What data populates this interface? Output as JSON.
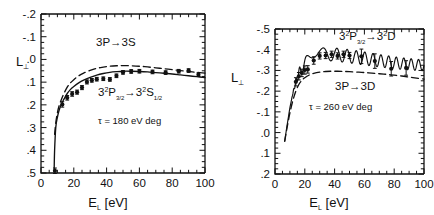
{
  "figure": {
    "background": "#ffffff",
    "ink": "#111111",
    "panels": [
      "left",
      "right"
    ]
  },
  "panel_left": {
    "xlabel_main": "E",
    "xlabel_sub": "L",
    "xlabel_unit": "[eV]",
    "ylabel_main": "L",
    "ylabel_sub": "⊥",
    "xticks": [
      "0",
      "20",
      "40",
      "60",
      "80",
      "100"
    ],
    "yticks": [
      ".5",
      ".4",
      ".3",
      ".2",
      ".1",
      ".0",
      "-.1",
      "-.2"
    ],
    "annotation_theory": "3P→3S",
    "annotation_fine": {
      "a": "3",
      "a_sup": "2",
      "b": "P",
      "b_sub": "3/2",
      "arrow": "→",
      "c": "3",
      "c_sup": "2",
      "d": "S",
      "d_sub": "1/2"
    },
    "annotation_tau": "τ = 180 eV deg"
  },
  "panel_right": {
    "xlabel_main": "E",
    "xlabel_sub": "L",
    "xlabel_unit": "[eV]",
    "ylabel_main": "L",
    "ylabel_sub": "⊥",
    "xticks": [
      "0",
      "20",
      "40",
      "60",
      "80",
      "100"
    ],
    "yticks": [
      "-.5",
      "-.4",
      "-.3",
      "-.2",
      "-.1",
      ".0",
      ".1",
      ".2"
    ],
    "annotation_fine": {
      "a": "3",
      "a_sup": "2",
      "b": "P",
      "b_sub": "3/2",
      "arrow": "→",
      "c": "3",
      "c_sup": "2",
      "d": "D"
    },
    "annotation_theory": "3P→3D",
    "annotation_tau": "τ = 260 eV deg"
  },
  "chart_data": [
    {
      "type": "line",
      "panel": "left",
      "title": "",
      "xlabel": "E_L [eV]",
      "ylabel": "L_perp",
      "xlim": [
        0,
        100
      ],
      "ylim": [
        -0.2,
        0.5
      ],
      "xticks": [
        0,
        20,
        40,
        60,
        80,
        100
      ],
      "yticks": [
        -0.2,
        -0.1,
        0.0,
        0.1,
        0.2,
        0.3,
        0.4,
        0.5
      ],
      "xminor_step": 5,
      "yminor_step": 0.025,
      "y_inverted": false,
      "grid": false,
      "legend": "none",
      "annotations": [
        {
          "text": "3P→3S",
          "x": 48,
          "y": 0.345
        },
        {
          "text": "3²P3/2→3²S1/2",
          "x": 52,
          "y": 0.135
        },
        {
          "text": "τ = 180 eV deg",
          "x": 52,
          "y": 0.02
        }
      ],
      "series": [
        {
          "name": "3P-3S theory (dashed)",
          "style": "dashed",
          "x": [
            8.3,
            9,
            10,
            11,
            12.5,
            14,
            16,
            18,
            20,
            23,
            26,
            30,
            34,
            38,
            42,
            46,
            50,
            55,
            60,
            65,
            70,
            75,
            80,
            85,
            90,
            95,
            100
          ],
          "y": [
            -0.03,
            0.02,
            0.065,
            0.095,
            0.125,
            0.15,
            0.178,
            0.197,
            0.211,
            0.228,
            0.24,
            0.252,
            0.261,
            0.266,
            0.27,
            0.272,
            0.273,
            0.272,
            0.27,
            0.267,
            0.263,
            0.259,
            0.255,
            0.251,
            0.247,
            0.243,
            0.24
          ]
        },
        {
          "name": "3²P3/2-3²S1/2 theory (solid)",
          "style": "solid",
          "x": [
            8.0,
            8.3,
            9,
            10,
            11,
            12.5,
            14,
            16,
            18,
            20,
            23,
            26,
            30,
            34,
            38,
            42,
            46,
            50,
            55,
            60,
            65,
            70,
            75,
            80,
            85,
            90,
            95,
            100
          ],
          "y": [
            -0.195,
            -0.1,
            0.0,
            0.045,
            0.075,
            0.105,
            0.125,
            0.15,
            0.168,
            0.181,
            0.197,
            0.209,
            0.221,
            0.231,
            0.238,
            0.243,
            0.246,
            0.248,
            0.248,
            0.247,
            0.245,
            0.242,
            0.239,
            0.236,
            0.232,
            0.228,
            0.224,
            0.22
          ]
        }
      ],
      "points": {
        "name": "experiment",
        "marker": "filled-circle",
        "x": [
          8.5,
          13,
          16,
          19,
          22,
          25,
          28,
          31,
          34,
          38,
          42,
          46,
          50,
          55,
          60,
          68,
          76,
          84,
          90,
          96
        ],
        "y": [
          -0.19,
          0.102,
          0.131,
          0.148,
          0.156,
          0.176,
          0.201,
          0.208,
          0.213,
          0.215,
          0.212,
          0.228,
          0.243,
          0.247,
          0.248,
          0.245,
          0.242,
          0.248,
          0.251,
          0.233
        ],
        "yerr": [
          0.012,
          0.012,
          0.01,
          0.01,
          0.009,
          0.009,
          0.009,
          0.008,
          0.008,
          0.008,
          0.008,
          0.008,
          0.008,
          0.008,
          0.008,
          0.008,
          0.008,
          0.008,
          0.008,
          0.008
        ]
      }
    },
    {
      "type": "line",
      "panel": "right",
      "title": "",
      "xlabel": "E_L [eV]",
      "ylabel": "L_perp",
      "xlim": [
        0,
        100
      ],
      "ylim": [
        -0.5,
        0.2
      ],
      "xticks": [
        0,
        20,
        40,
        60,
        80,
        100
      ],
      "yticks": [
        -0.5,
        -0.4,
        -0.3,
        -0.2,
        -0.1,
        0.0,
        0.1,
        0.2
      ],
      "xminor_step": 5,
      "yminor_step": 0.025,
      "y_inverted": true,
      "grid": false,
      "legend": "none",
      "annotations": [
        {
          "text": "3²P3/2→3²D",
          "x": 72,
          "y": -0.455
        },
        {
          "text": "3P→3D",
          "x": 72,
          "y": -0.215
        },
        {
          "text": "τ = 260 eV deg",
          "x": 50,
          "y": -0.145
        }
      ],
      "series": [
        {
          "name": "3P-3D theory (dashed)",
          "style": "dashed",
          "x": [
            6.5,
            8,
            10,
            12,
            14,
            16,
            18,
            20,
            23,
            26,
            30,
            34,
            38,
            42,
            46,
            50,
            55,
            60,
            65,
            70,
            75,
            80,
            85,
            90,
            95,
            100
          ],
          "y": [
            0.042,
            -0.02,
            -0.095,
            -0.155,
            -0.2,
            -0.232,
            -0.252,
            -0.265,
            -0.278,
            -0.286,
            -0.292,
            -0.295,
            -0.296,
            -0.296,
            -0.295,
            -0.294,
            -0.292,
            -0.29,
            -0.287,
            -0.284,
            -0.281,
            -0.277,
            -0.273,
            -0.268,
            -0.263,
            -0.258
          ]
        },
        {
          "name": "3²P3/2-3²D theory (solid, oscillatory)",
          "style": "solid-oscillating",
          "baseline_x": [
            6.5,
            8,
            10,
            12,
            14,
            16,
            18,
            20,
            23,
            26,
            30,
            34,
            38,
            42,
            46,
            50,
            55,
            60,
            65,
            70,
            75,
            80,
            85,
            90,
            95,
            100
          ],
          "baseline_y": [
            0.042,
            -0.03,
            -0.12,
            -0.19,
            -0.245,
            -0.285,
            -0.312,
            -0.33,
            -0.352,
            -0.365,
            -0.375,
            -0.378,
            -0.378,
            -0.375,
            -0.372,
            -0.368,
            -0.363,
            -0.358,
            -0.352,
            -0.347,
            -0.342,
            -0.337,
            -0.333,
            -0.33,
            -0.327,
            -0.325
          ],
          "oscillation_amplitude": 0.032,
          "oscillation_note": "Ramsey-type oscillations; period grows with energy (short/dense below 40 eV, wide lobes above 60 eV)"
        }
      ],
      "points": {
        "name": "experiment",
        "marker": "filled-circle",
        "x": [
          14,
          16,
          18,
          20,
          22,
          26,
          30,
          34,
          38,
          42,
          46,
          50,
          58,
          67,
          78,
          88
        ],
        "y": [
          -0.245,
          -0.272,
          -0.288,
          -0.302,
          -0.305,
          -0.348,
          -0.37,
          -0.372,
          -0.378,
          -0.37,
          -0.378,
          -0.372,
          -0.368,
          -0.345,
          -0.308,
          -0.312
        ],
        "yerr": [
          0.02,
          0.018,
          0.018,
          0.02,
          0.018,
          0.018,
          0.015,
          0.015,
          0.015,
          0.015,
          0.015,
          0.015,
          0.035,
          0.035,
          0.035,
          0.035
        ]
      }
    }
  ]
}
